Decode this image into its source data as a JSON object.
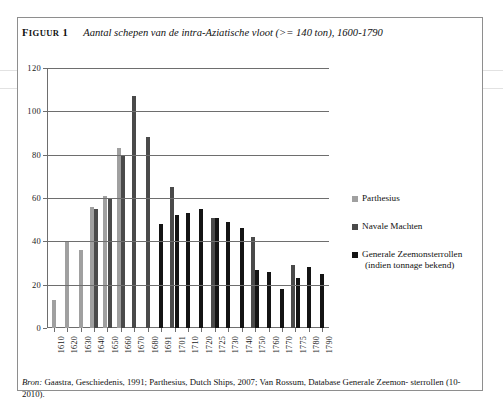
{
  "figure": {
    "label_prefix": "F",
    "label_rest": "IGUUR",
    "label_number": "1",
    "title": "Aantal schepen van de intra-Aziatische vloot (>= 140 ton), 1600-1790"
  },
  "source_note": {
    "prefix": "Bron:",
    "text_line1": "Gaastra, Geschiedenis, 1991; Parthesius, Dutch Ships, 2007; Van Rossum, Database Generale Zeemon-",
    "text_line2": "sterrollen (10-2010)."
  },
  "legend": {
    "items": [
      {
        "label": "Parthesius",
        "sublabel": "",
        "color": "#a0a0a0"
      },
      {
        "label": "Navale Machten",
        "sublabel": "",
        "color": "#4a4a4a"
      },
      {
        "label": "Generale Zeemonsterrollen",
        "sublabel": "(indien tonnage bekend)",
        "color": "#141414"
      }
    ]
  },
  "chart_data": {
    "type": "bar",
    "title": "Aantal schepen van de intra-Aziatische vloot (>= 140 ton), 1600-1790",
    "xlabel": "",
    "ylabel": "",
    "ylim": [
      0,
      120
    ],
    "yticks": [
      0,
      20,
      40,
      60,
      80,
      100,
      120
    ],
    "grid": true,
    "legend_position": "right",
    "categories": [
      "1610",
      "1620",
      "1630",
      "1640",
      "1650",
      "1660",
      "1670",
      "1680",
      "1691",
      "1701",
      "1710",
      "1720",
      "1725",
      "1730",
      "1740",
      "1750",
      "1760",
      "1770",
      "1775",
      "1780",
      "1790"
    ],
    "series": [
      {
        "name": "Parthesius",
        "color": "#a0a0a0",
        "values": [
          13,
          40,
          36,
          56,
          61,
          83,
          null,
          null,
          null,
          null,
          null,
          null,
          null,
          null,
          null,
          null,
          null,
          null,
          null,
          null,
          null
        ]
      },
      {
        "name": "Navale Machten",
        "color": "#4a4a4a",
        "values": [
          null,
          null,
          null,
          55,
          60,
          80,
          107,
          88,
          null,
          65,
          null,
          null,
          51,
          null,
          null,
          42,
          null,
          null,
          29,
          null,
          null
        ]
      },
      {
        "name": "Generale Zeemonsterrollen (indien tonnage bekend)",
        "color": "#141414",
        "values": [
          null,
          null,
          null,
          null,
          null,
          null,
          null,
          null,
          48,
          52,
          53,
          55,
          51,
          49,
          46,
          27,
          26,
          18,
          23,
          28,
          25
        ]
      }
    ]
  }
}
